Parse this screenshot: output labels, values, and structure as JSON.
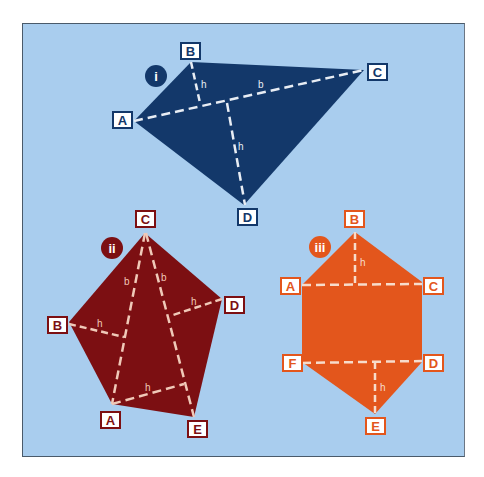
{
  "diagram": {
    "background": "#a9cdee",
    "shapes": [
      {
        "id": "i",
        "badge": "i",
        "color": "#13386a",
        "vertices": {
          "A": "A",
          "B": "B",
          "C": "C",
          "D": "D"
        },
        "line_labels": {
          "base": "b",
          "height_top": "h",
          "height_bottom": "h"
        }
      },
      {
        "id": "ii",
        "badge": "ii",
        "color": "#7c0f12",
        "vertices": {
          "A": "A",
          "B": "B",
          "C": "C",
          "D": "D",
          "E": "E"
        },
        "line_labels": {
          "base_left": "b",
          "base_right": "b",
          "height_B": "h",
          "height_D": "h",
          "height_E": "h"
        }
      },
      {
        "id": "iii",
        "badge": "iii",
        "color": "#e3561c",
        "vertices": {
          "A": "A",
          "B": "B",
          "C": "C",
          "D": "D",
          "E": "E",
          "F": "F"
        },
        "line_labels": {
          "height_top": "h",
          "height_bottom": "h"
        }
      }
    ]
  }
}
